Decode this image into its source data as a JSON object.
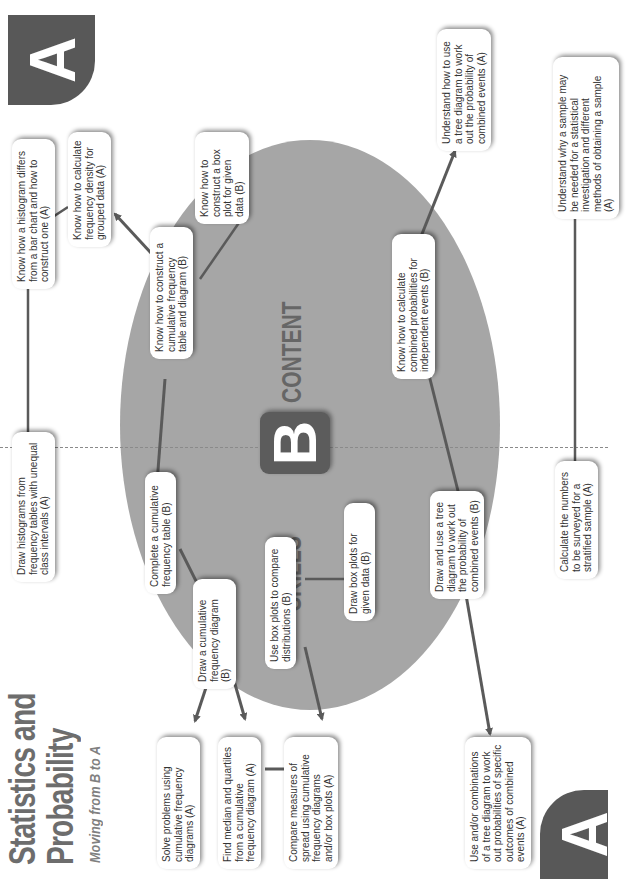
{
  "header": {
    "title_line1": "Statistics and",
    "title_line2": "Probability",
    "subtitle": "Moving from B to A"
  },
  "badges": {
    "top_level": "A",
    "bottom_level": "A",
    "center_level": "B"
  },
  "center": {
    "left_label": "SKILLS",
    "right_label": "CONTENT"
  },
  "nodes": {
    "solve_problems": "Solve problems using cumulative frequency diagrams (A)",
    "find_median": "Find median and quartiles from a cumulative frequency diagram (A)",
    "compare_spread": "Compare measures of spread using cumulative frequency diagrams and/or box plots (A)",
    "use_combinations": "Use and/or combinations of a tree diagram to work out probabilities of specific outcomes of combined events (A)",
    "draw_cum_diagram": "Draw a cumulative frequency diagram (B)",
    "use_box_plots": "Use box plots to compare distributions (B)",
    "draw_box_plots": "Draw box plots for given data (B)",
    "complete_cum_table": "Complete a cumulative frequency table (B)",
    "draw_tree": "Draw and use a tree diagram to work out the probability of combined events (B)",
    "draw_histograms": "Draw histograms from frequency tables with unequal class intervals (A)",
    "calc_stratified": "Calculate the numbers to be surveyed for a stratified sample (A)",
    "construct_cum": "Know how to construct a cumulative frequency table and diagram (B)",
    "combined_prob": "Know how to calculate combined probabilities for independent events (B)",
    "histogram_diff": "Know how a histogram differs from a bar chart and how to construct one (A)",
    "construct_box": "Know how to construct a box plot for given data (B)",
    "understand_sample": "Understand why a sample may be needed for a statistical investigation and different methods of obtaining a sample (A)",
    "freq_density": "Know how to calculate frequency density for grouped data (A)",
    "understand_tree": "Understand how to use a tree diagram to work out the probability of combined events (A)"
  },
  "colors": {
    "ellipse": "#a6a6a6",
    "badge": "#585858",
    "connector": "#5a5a5a",
    "title": "#6d6d6d"
  }
}
